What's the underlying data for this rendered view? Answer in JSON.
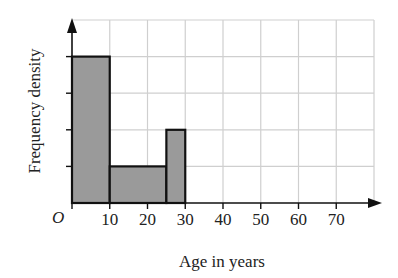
{
  "chart_data": {
    "type": "bar",
    "subtype": "histogram",
    "title": "",
    "xlabel": "Age in years",
    "ylabel": "Frequency density",
    "origin_label": "O",
    "x_ticks": [
      "10",
      "20",
      "30",
      "40",
      "50",
      "60",
      "70"
    ],
    "xlim": [
      0,
      80
    ],
    "ylim": [
      0,
      5
    ],
    "y_tick_labels": [],
    "grid": true,
    "bins": [
      {
        "from": 0,
        "to": 10,
        "height": 4
      },
      {
        "from": 10,
        "to": 25,
        "height": 1
      },
      {
        "from": 25,
        "to": 30,
        "height": 2
      }
    ],
    "bar_color": "#9a9a9a",
    "grid_color": "#cfcfcf"
  }
}
